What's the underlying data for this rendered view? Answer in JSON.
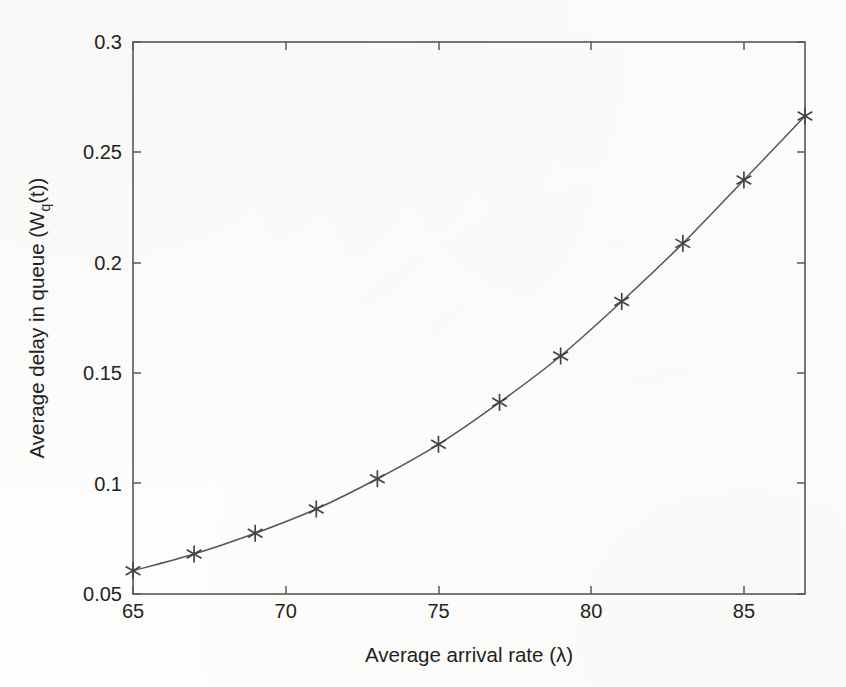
{
  "chart_data": {
    "type": "line",
    "title": "",
    "xlabel": "Average arrival rate (λ)",
    "ylabel": "Average delay in queue (W",
    "ylabel_sub": "q",
    "ylabel_tail": "(t))",
    "xlim": [
      65,
      87
    ],
    "ylim": [
      0.05,
      0.3
    ],
    "grid": false,
    "legend": null,
    "marker": "asterisk",
    "line_color": "#555555",
    "marker_color": "#444444",
    "axis_color": "#555555",
    "background_color": "#fdfdfb",
    "x": [
      65,
      67,
      69,
      71,
      73,
      75,
      77,
      79,
      81,
      83,
      85,
      87
    ],
    "values": [
      0.0605,
      0.0681,
      0.0775,
      0.0885,
      0.1022,
      0.1178,
      0.1368,
      0.1578,
      0.1825,
      0.2088,
      0.2375,
      0.2665
    ],
    "series": [
      {
        "name": "Average delay in queue",
        "values": [
          0.0605,
          0.0681,
          0.0775,
          0.0885,
          0.1022,
          0.1178,
          0.1368,
          0.1578,
          0.1825,
          0.2088,
          0.2375,
          0.2665
        ]
      }
    ],
    "xticks": [
      65,
      70,
      75,
      80,
      85
    ],
    "xticklabels": [
      "65",
      "70",
      "75",
      "80",
      "85"
    ],
    "yticks": [
      0.05,
      0.1,
      0.15,
      0.2,
      0.25,
      0.3
    ],
    "yticklabels": [
      "0.05",
      "0.1",
      "0.15",
      "0.2",
      "0.25",
      "0.3"
    ]
  },
  "axes_geometry": {
    "left": 133,
    "right": 805,
    "top": 42,
    "bottom": 594
  }
}
